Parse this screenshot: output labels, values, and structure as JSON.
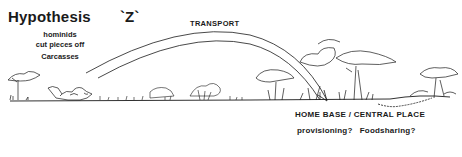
{
  "title": {
    "main": "Hypothesis",
    "label": "`Z`"
  },
  "annotation": {
    "lines": [
      "hominids",
      "cut pieces off",
      "Carcasses"
    ]
  },
  "arrow_label": "TRANSPORT",
  "destination": {
    "label": "HOME BASE / CENTRAL PLACE",
    "questions": "provisioning?   Foodsharing?"
  },
  "colors": {
    "ink": "#1a1a1a",
    "background": "#ffffff"
  },
  "icons": [
    "acacia-tree-icon",
    "carcass-icon",
    "grass-icon",
    "bush-icon",
    "palm-tree-icon",
    "transport-arc-arrow"
  ]
}
